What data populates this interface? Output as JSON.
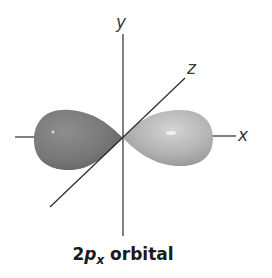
{
  "diagram": {
    "title": "2px orbital",
    "caption": {
      "prefix": "2",
      "variable": "p",
      "subscript": "x",
      "suffix": " orbital"
    },
    "axes": {
      "x_label": "x",
      "y_label": "y",
      "z_label": "z"
    },
    "lobes": [
      {
        "name": "left lobe",
        "shade": "dark gray"
      },
      {
        "name": "right lobe",
        "shade": "light gray"
      }
    ],
    "colors": {
      "left_lobe": "#7b7b7b",
      "right_lobe": "#b3b3b3",
      "axis": "#2a2a2a",
      "background": "#ffffff"
    }
  }
}
